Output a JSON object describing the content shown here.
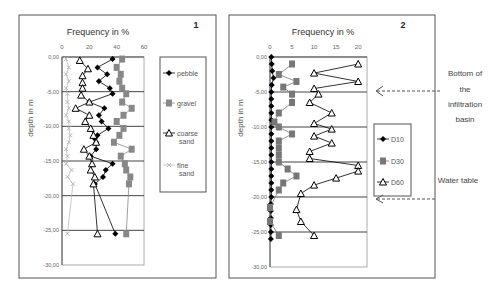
{
  "chart_data": [
    {
      "type": "line",
      "panel_label": "1",
      "title": "Frequency in %",
      "xlabel": "Frequency in %",
      "ylabel": "depth in m",
      "xlim": [
        0,
        60
      ],
      "ylim": [
        -30,
        0
      ],
      "x_ticks": [
        "0",
        "20",
        "40",
        "60"
      ],
      "y_ticks": [
        "0,00",
        "-5,00",
        "-10,00",
        "-15,00",
        "-20,00",
        "-25,00",
        "-30,00"
      ],
      "grid": "horizontal lines every 5 m",
      "legend_position": "right",
      "series": [
        {
          "name": "pebble",
          "marker": "diamond",
          "color": "#000000",
          "depth": [
            -0.3,
            -1.5,
            -2.5,
            -3.5,
            -4.5,
            -5.3,
            -6.5,
            -7.4,
            -8.4,
            -9.3,
            -10.3,
            -11.3,
            -11.8,
            -12.3,
            -13.3,
            -14.3,
            -15.4,
            -16.3,
            -17.3,
            -18.3,
            -25.5
          ],
          "values": [
            37,
            26,
            33,
            27,
            35,
            37,
            20,
            31,
            27,
            29,
            34,
            26,
            24,
            25,
            25,
            21,
            37,
            32,
            30,
            24,
            39
          ]
        },
        {
          "name": "gravel",
          "marker": "square",
          "color": "#888888",
          "depth": [
            -0.3,
            -1.5,
            -2.5,
            -3.5,
            -4.5,
            -5.3,
            -6.5,
            -7.4,
            -8.4,
            -9.3,
            -10.3,
            -11.3,
            -12.3,
            -13.3,
            -14.3,
            -15.4,
            -16.3,
            -17.3,
            -18.3,
            -25.5
          ],
          "values": [
            44,
            40,
            43,
            42,
            44,
            47,
            44,
            51,
            45,
            40,
            45,
            42,
            38,
            51,
            43,
            46,
            47,
            50,
            49,
            47
          ]
        },
        {
          "name": "coarse sand",
          "marker": "triangle",
          "color": "#000000",
          "depth": [
            -0.5,
            -1.7,
            -2.7,
            -3.7,
            -4.5,
            -5.5,
            -6.5,
            -7.4,
            -8.4,
            -9.3,
            -10.3,
            -11.3,
            -12.3,
            -13.3,
            -14.3,
            -15.4,
            -16.3,
            -17.3,
            -18.3,
            -25.5
          ],
          "values": [
            13,
            19,
            15,
            15,
            15,
            14,
            20,
            10,
            20,
            17,
            21,
            23,
            25,
            16,
            20,
            22,
            21,
            24,
            23,
            26
          ]
        },
        {
          "name": "fine sand",
          "marker": "x",
          "color": "#bbbbbb",
          "depth": [
            -0.3,
            -1.5,
            -2.5,
            -3.5,
            -4.5,
            -5.3,
            -6.5,
            -7.4,
            -8.4,
            -9.3,
            -10.3,
            -11.3,
            -12.3,
            -13.3,
            -14.3,
            -15.4,
            -16.3,
            -17.3,
            -18.3,
            -25.5
          ],
          "values": [
            3,
            5,
            3,
            5,
            3,
            4,
            4,
            5,
            3,
            5,
            5,
            6,
            5,
            3,
            4,
            3,
            7,
            4,
            8,
            4
          ]
        }
      ]
    },
    {
      "type": "line",
      "panel_label": "2",
      "title": "Frequency in %",
      "xlabel": "Frequency in %",
      "ylabel": "depth in m",
      "xlim": [
        0,
        22
      ],
      "ylim": [
        -30,
        0
      ],
      "x_ticks": [
        "0",
        "5",
        "10",
        "15",
        "20"
      ],
      "y_ticks": [
        "0,00",
        "-5,00",
        "-10,00",
        "-15,00",
        "-20,00",
        "-25,00",
        "-30,00"
      ],
      "grid": "horizontal lines every 5 m",
      "legend_position": "right",
      "series": [
        {
          "name": "D10",
          "marker": "diamond",
          "color": "#000000",
          "depth": [
            0,
            -1,
            -2,
            -3,
            -4,
            -5,
            -6,
            -7,
            -8,
            -9,
            -10,
            -11,
            -12,
            -13,
            -14,
            -15,
            -16,
            -17,
            -18,
            -19,
            -20,
            -21,
            -22,
            -23,
            -24,
            -25,
            -26
          ],
          "values": [
            0.3,
            0.4,
            0.5,
            0.8,
            0.4,
            0.3,
            0.3,
            0.3,
            0.3,
            0.3,
            0.3,
            0.3,
            0.3,
            0.3,
            0.3,
            0.3,
            0.3,
            0.3,
            0.3,
            0.3,
            0.3,
            0.2,
            0.2,
            0.2,
            0.2,
            0.2,
            0.2
          ]
        },
        {
          "name": "D30",
          "marker": "square",
          "color": "#777777",
          "depth": [
            -1,
            -2.5,
            -3.5,
            -4.3,
            -5.3,
            -6.5,
            -8,
            -9.3,
            -10,
            -11,
            -12,
            -13,
            -14,
            -15,
            -16,
            -17,
            -18,
            -19,
            -21.5,
            -23.5,
            -25.5
          ],
          "values": [
            5,
            2,
            6,
            3,
            5,
            5,
            2,
            1,
            2,
            5,
            2,
            2,
            2,
            2,
            4,
            6,
            3,
            2,
            0,
            0,
            2
          ]
        },
        {
          "name": "D60",
          "marker": "triangle",
          "color": "#000000",
          "depth": [
            -1,
            -2.3,
            -3.5,
            -4.5,
            -5.3,
            -6.5,
            -8,
            -9.5,
            -10.3,
            -11.3,
            -12.3,
            -13.5,
            -14.5,
            -15.5,
            -16.3,
            -17.3,
            -18.3,
            -19.5,
            -21.8,
            -23.5,
            -25.5
          ],
          "values": [
            20,
            10,
            20,
            10,
            11,
            9,
            14,
            10,
            14,
            10,
            14,
            9,
            9,
            20,
            20,
            15,
            10,
            7,
            6,
            7,
            10
          ]
        }
      ]
    }
  ],
  "annotations": {
    "bottom_basin": [
      "Bottom of",
      "the",
      "infiltration",
      "basin"
    ],
    "water_table": "Water table"
  },
  "labels": {
    "panel1_num": "1",
    "panel2_num": "2",
    "freq_title": "Frequency in %",
    "depth_label": "depth in m"
  }
}
